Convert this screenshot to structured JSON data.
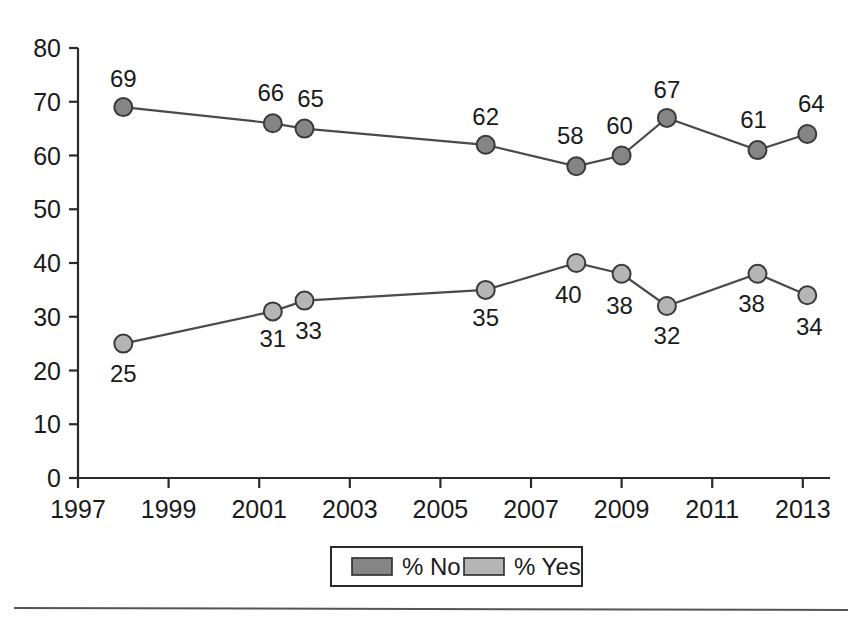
{
  "chart_data": {
    "type": "line",
    "title": "",
    "subtitle": "",
    "xlabel": "",
    "ylabel": "",
    "xlim": [
      1997,
      2013.6
    ],
    "ylim": [
      0,
      80
    ],
    "grid": false,
    "legend_position": "bottom-center",
    "y_ticks": [
      "80",
      "70",
      "60",
      "50",
      "40",
      "30",
      "20",
      "10",
      "0"
    ],
    "y_tick_values": [
      80,
      70,
      60,
      50,
      40,
      30,
      20,
      10,
      0
    ],
    "x_ticks": [
      "1997",
      "1999",
      "2001",
      "2003",
      "2005",
      "2007",
      "2009",
      "2011",
      "2013"
    ],
    "x_tick_values": [
      1997,
      1999,
      2001,
      2003,
      2005,
      2007,
      2009,
      2011,
      2013
    ],
    "x": [
      1998,
      2001.3,
      2002,
      2006,
      2008,
      2009,
      2010,
      2012,
      2013.1
    ],
    "series": [
      {
        "name": "% No",
        "color": "#858585",
        "values": [
          69,
          66,
          65,
          62,
          58,
          60,
          67,
          61,
          64
        ],
        "labels": [
          "69",
          "66",
          "65",
          "62",
          "58",
          "60",
          "67",
          "61",
          "64"
        ],
        "label_positions": [
          "above",
          "above",
          "above",
          "above",
          "above",
          "above",
          "above",
          "above",
          "above"
        ]
      },
      {
        "name": "% Yes",
        "color": "#b5b5b5",
        "values": [
          25,
          31,
          33,
          35,
          40,
          38,
          32,
          38,
          34
        ],
        "labels": [
          "25",
          "31",
          "33",
          "35",
          "40",
          "38",
          "32",
          "38",
          "34"
        ],
        "label_positions": [
          "below",
          "below",
          "below",
          "below",
          "below",
          "below",
          "below",
          "below",
          "below"
        ]
      }
    ]
  },
  "legend": {
    "items": [
      {
        "label": "% No",
        "color": "#858585"
      },
      {
        "label": "% Yes",
        "color": "#b5b5b5"
      }
    ]
  }
}
